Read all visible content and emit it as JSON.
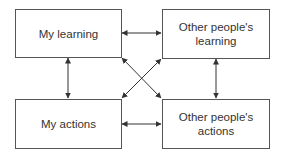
{
  "diagram": {
    "nodes": [
      {
        "id": "my-learning",
        "label": "My learning"
      },
      {
        "id": "others-learning",
        "label": "Other people's learning"
      },
      {
        "id": "my-actions",
        "label": "My actions"
      },
      {
        "id": "others-actions",
        "label": "Other people's actions"
      }
    ],
    "edges": [
      {
        "from": "my-learning",
        "to": "others-learning",
        "type": "bidirectional"
      },
      {
        "from": "my-actions",
        "to": "others-actions",
        "type": "bidirectional"
      },
      {
        "from": "my-learning",
        "to": "my-actions",
        "type": "bidirectional"
      },
      {
        "from": "others-learning",
        "to": "others-actions",
        "type": "bidirectional"
      },
      {
        "from": "my-learning",
        "to": "others-actions",
        "type": "bidirectional"
      },
      {
        "from": "others-learning",
        "to": "my-actions",
        "type": "bidirectional"
      }
    ],
    "colors": {
      "line": "#333333",
      "border": "#555555",
      "text": "#333333"
    }
  }
}
